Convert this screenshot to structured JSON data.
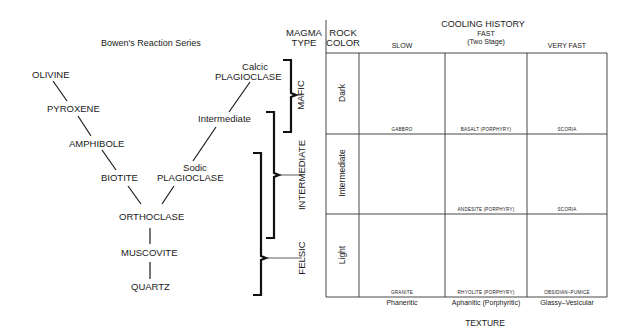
{
  "bowen": {
    "title": "Bowen's Reaction Series",
    "discontinuous": [
      "OLIVINE",
      "PYROXENE",
      "AMPHIBOLE",
      "BIOTITE"
    ],
    "continuous": {
      "calcic_1": "Calcic",
      "calcic_2": "PLAGIOCLASE",
      "intermediate": "Intermediate",
      "sodic_1": "Sodic",
      "sodic_2": "PLAGIOCLASE"
    },
    "merged": [
      "ORTHOCLASE",
      "MUSCOVITE",
      "QUARTZ"
    ]
  },
  "magma": {
    "header_1": "MAGMA",
    "header_2": "TYPE",
    "types": [
      "MAFIC",
      "INTERMEDIATE",
      "FELSIC"
    ]
  },
  "rock_color": {
    "header_1": "ROCK",
    "header_2": "COLOR",
    "rows": [
      "Dark",
      "Intermediate",
      "Light"
    ]
  },
  "cooling": {
    "title": "COOLING HISTORY",
    "columns": [
      "SLOW",
      "FAST",
      "(Two Stage)",
      "VERY FAST"
    ]
  },
  "cells": [
    [
      "GABBRO",
      "BASALT (PORPHYRY)",
      "SCORIA"
    ],
    [
      "",
      "ANDESITE (PORPHYRY)",
      "SCORIA"
    ],
    [
      "GRANITE",
      "RHYOLITE (PORPHYRY)",
      "OBSIDIAN–PUMICE"
    ]
  ],
  "texture": {
    "labels": [
      "Phaneritic",
      "Aphanitic (Porphyritic)",
      "Glassy–Vesicular"
    ],
    "title": "TEXTURE"
  }
}
